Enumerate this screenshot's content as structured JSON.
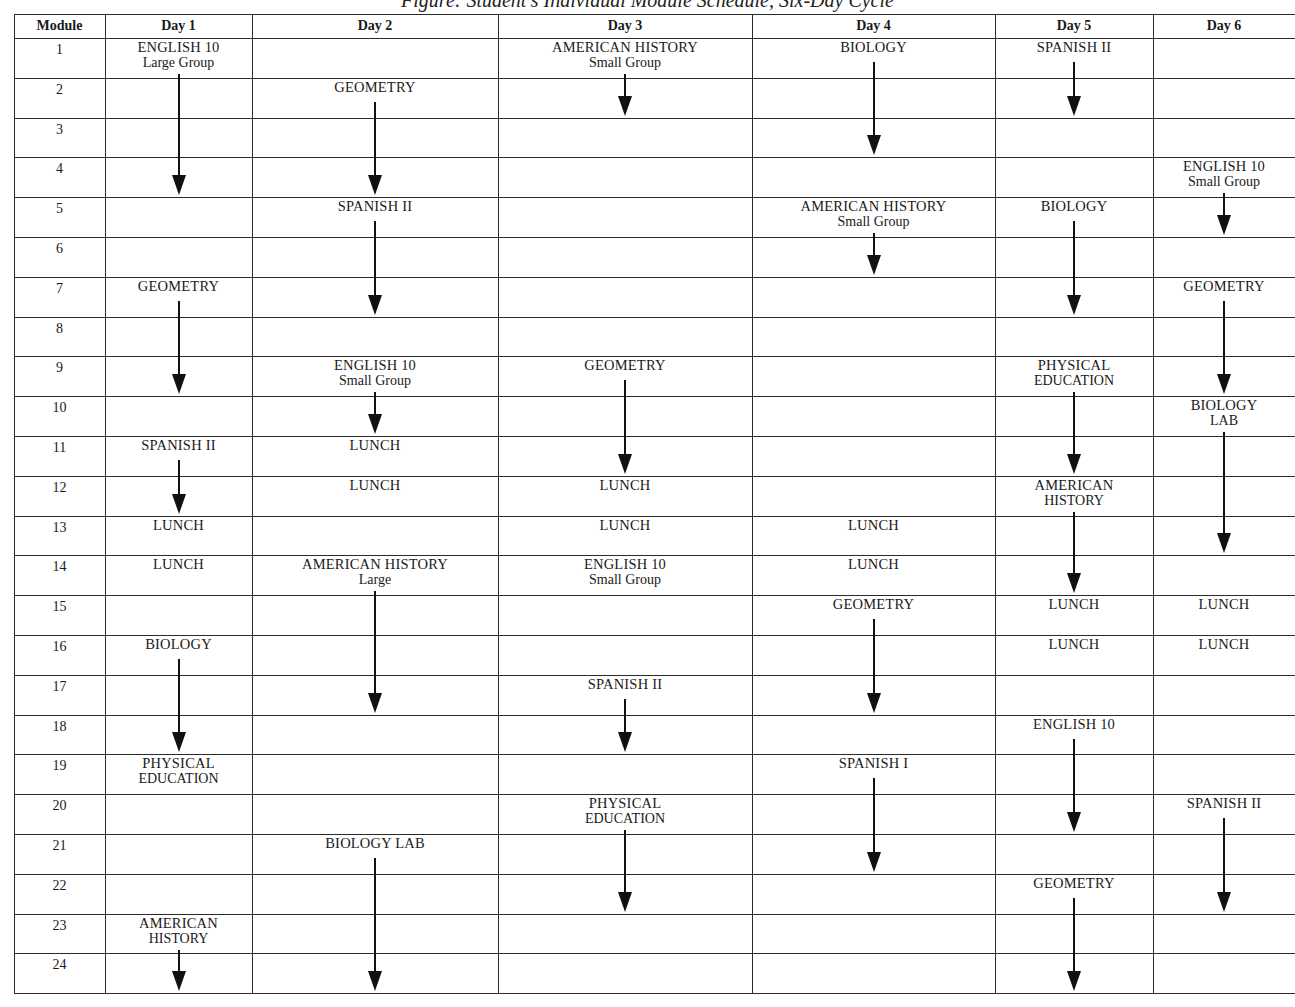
{
  "title": "Figure: Student's Individual Module Schedule, Six-Day Cycle",
  "table": {
    "module_header": "Module",
    "days": [
      "Day 1",
      "Day 2",
      "Day 3",
      "Day 4",
      "Day 5",
      "Day 6"
    ],
    "modules": [
      "1",
      "2",
      "3",
      "4",
      "5",
      "6",
      "7",
      "8",
      "9",
      "10",
      "11",
      "12",
      "13",
      "14",
      "15",
      "16",
      "17",
      "18",
      "19",
      "20",
      "21",
      "22",
      "23",
      "24"
    ]
  },
  "schedule": [
    {
      "day": 1,
      "course": "ENGLISH 10",
      "sub": "Large Group",
      "start": 1,
      "end": 4
    },
    {
      "day": 1,
      "course": "GEOMETRY",
      "sub": "",
      "start": 7,
      "end": 9
    },
    {
      "day": 1,
      "course": "SPANISH II",
      "sub": "",
      "start": 11,
      "end": 12
    },
    {
      "day": 1,
      "course": "LUNCH",
      "sub": "",
      "start": 13,
      "end": 13
    },
    {
      "day": 1,
      "course": "LUNCH",
      "sub": "",
      "start": 14,
      "end": 14
    },
    {
      "day": 1,
      "course": "BIOLOGY",
      "sub": "",
      "start": 16,
      "end": 18
    },
    {
      "day": 1,
      "course": "PHYSICAL",
      "sub": "EDUCATION",
      "start": 19,
      "end": 19
    },
    {
      "day": 1,
      "course": "AMERICAN",
      "sub": "HISTORY",
      "start": 23,
      "end": 24
    },
    {
      "day": 2,
      "course": "GEOMETRY",
      "sub": "",
      "start": 2,
      "end": 4
    },
    {
      "day": 2,
      "course": "SPANISH II",
      "sub": "",
      "start": 5,
      "end": 7
    },
    {
      "day": 2,
      "course": "ENGLISH 10",
      "sub": "Small Group",
      "start": 9,
      "end": 10
    },
    {
      "day": 2,
      "course": "LUNCH",
      "sub": "",
      "start": 11,
      "end": 11
    },
    {
      "day": 2,
      "course": "LUNCH",
      "sub": "",
      "start": 12,
      "end": 12
    },
    {
      "day": 2,
      "course": "AMERICAN HISTORY",
      "sub": "Large",
      "start": 14,
      "end": 17
    },
    {
      "day": 2,
      "course": "BIOLOGY LAB",
      "sub": "",
      "start": 21,
      "end": 24
    },
    {
      "day": 3,
      "course": "AMERICAN HISTORY",
      "sub": "Small Group",
      "start": 1,
      "end": 2
    },
    {
      "day": 3,
      "course": "GEOMETRY",
      "sub": "",
      "start": 9,
      "end": 11
    },
    {
      "day": 3,
      "course": "LUNCH",
      "sub": "",
      "start": 12,
      "end": 12
    },
    {
      "day": 3,
      "course": "LUNCH",
      "sub": "",
      "start": 13,
      "end": 13
    },
    {
      "day": 3,
      "course": "ENGLISH 10",
      "sub": "Small Group",
      "start": 14,
      "end": 14
    },
    {
      "day": 3,
      "course": "SPANISH II",
      "sub": "",
      "start": 17,
      "end": 18
    },
    {
      "day": 3,
      "course": "PHYSICAL",
      "sub": "EDUCATION",
      "start": 20,
      "end": 22
    },
    {
      "day": 4,
      "course": "BIOLOGY",
      "sub": "",
      "start": 1,
      "end": 3
    },
    {
      "day": 4,
      "course": "AMERICAN HISTORY",
      "sub": "Small Group",
      "start": 5,
      "end": 6
    },
    {
      "day": 4,
      "course": "LUNCH",
      "sub": "",
      "start": 13,
      "end": 13
    },
    {
      "day": 4,
      "course": "LUNCH",
      "sub": "",
      "start": 14,
      "end": 14
    },
    {
      "day": 4,
      "course": "GEOMETRY",
      "sub": "",
      "start": 15,
      "end": 17
    },
    {
      "day": 4,
      "course": "SPANISH I",
      "sub": "",
      "start": 19,
      "end": 21
    },
    {
      "day": 5,
      "course": "SPANISH II",
      "sub": "",
      "start": 1,
      "end": 2
    },
    {
      "day": 5,
      "course": "BIOLOGY",
      "sub": "",
      "start": 5,
      "end": 7
    },
    {
      "day": 5,
      "course": "PHYSICAL",
      "sub": "EDUCATION",
      "start": 9,
      "end": 11
    },
    {
      "day": 5,
      "course": "AMERICAN",
      "sub": "HISTORY",
      "start": 12,
      "end": 14
    },
    {
      "day": 5,
      "course": "LUNCH",
      "sub": "",
      "start": 15,
      "end": 15
    },
    {
      "day": 5,
      "course": "LUNCH",
      "sub": "",
      "start": 16,
      "end": 16
    },
    {
      "day": 5,
      "course": "ENGLISH 10",
      "sub": "",
      "start": 18,
      "end": 20
    },
    {
      "day": 5,
      "course": "GEOMETRY",
      "sub": "",
      "start": 22,
      "end": 24
    },
    {
      "day": 6,
      "course": "ENGLISH 10",
      "sub": "Small Group",
      "start": 4,
      "end": 5
    },
    {
      "day": 6,
      "course": "GEOMETRY",
      "sub": "",
      "start": 7,
      "end": 9
    },
    {
      "day": 6,
      "course": "BIOLOGY",
      "sub": "LAB",
      "start": 10,
      "end": 13
    },
    {
      "day": 6,
      "course": "LUNCH",
      "sub": "",
      "start": 15,
      "end": 15
    },
    {
      "day": 6,
      "course": "LUNCH",
      "sub": "",
      "start": 16,
      "end": 16
    },
    {
      "day": 6,
      "course": "SPANISH II",
      "sub": "",
      "start": 20,
      "end": 22
    }
  ],
  "colors": {
    "ink": "#1a1a1a",
    "rule": "#2a2a2a",
    "paper": "#ffffff"
  }
}
